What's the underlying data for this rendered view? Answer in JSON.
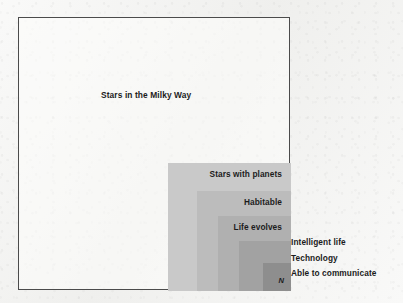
{
  "figure": {
    "outer_set_label": "Stars in the Milky Way",
    "innermost_symbol": "N",
    "frame_border_color": "#4b4b4b",
    "paper_color": "#f3f3f1"
  },
  "nested_sets": [
    {
      "label": "Stars with planets",
      "fill": "#c9c9c9",
      "label_placement": "inside"
    },
    {
      "label": "Habitable",
      "fill": "#bcbcbc",
      "label_placement": "inside"
    },
    {
      "label": "Life evolves",
      "fill": "#b0b0b0",
      "label_placement": "inside"
    },
    {
      "label": "Intelligent life",
      "fill": "#a2a2a2",
      "label_placement": "outside-right"
    },
    {
      "label": "Technology",
      "fill": "#8e8e8e",
      "label_placement": "outside-right"
    },
    {
      "label": "Able to communicate",
      "fill": "#8e8e8e",
      "label_placement": "outside-right"
    }
  ],
  "outside_labels": [
    "Intelligent life",
    "Technology",
    "Able to communicate"
  ],
  "chart_data": {
    "type": "table",
    "title": "Stars in the Milky Way",
    "xlabel": "",
    "ylabel": "",
    "categories": [
      "Stars in the Milky Way",
      "Stars with planets",
      "Habitable",
      "Life evolves",
      "Intelligent life",
      "Technology",
      "Able to communicate"
    ],
    "values": [
      272,
      123,
      94,
      73,
      52,
      40,
      28
    ],
    "value_units": "rectangle width in px (relative set size)",
    "grid": false,
    "legend": "none",
    "annotations": [
      "N"
    ]
  }
}
